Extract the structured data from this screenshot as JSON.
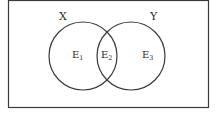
{
  "diagram": {
    "type": "venn",
    "universe": {
      "label": ""
    },
    "sets": [
      {
        "name": "X",
        "label": "X"
      },
      {
        "name": "Y",
        "label": "Y"
      }
    ],
    "regions": [
      {
        "id": "E1",
        "base": "E",
        "sub": "1",
        "description": "X only"
      },
      {
        "id": "E2",
        "base": "E",
        "sub": "2",
        "description": "X and Y"
      },
      {
        "id": "E3",
        "base": "E",
        "sub": "3",
        "description": "Y only"
      }
    ],
    "colors": {
      "stroke": "#3a3a3a",
      "text": "#2a2a2a",
      "background": "#ffffff"
    }
  }
}
